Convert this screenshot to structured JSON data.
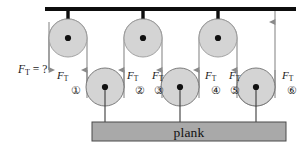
{
  "figure": {
    "colors": {
      "pulley_fill": "#d4d4d4",
      "pulley_stroke": "#8c8c8c",
      "plank_fill": "#a9a9a9",
      "plank_stroke": "#4a4a4a",
      "rope": "#8a8a8a",
      "support_bar": "#0d0d0d",
      "hub": "#111111",
      "text": "#1a1a1a"
    },
    "unknown_force": {
      "symbol": "F",
      "subscript": "T",
      "equals": "= ?"
    },
    "plank": {
      "label": "plank"
    },
    "force_labels": [
      {
        "id": "ft-1",
        "symbol": "F",
        "subscript": "T",
        "x": 57,
        "y": 70
      },
      {
        "id": "ft-2",
        "symbol": "F",
        "subscript": "T",
        "x": 127,
        "y": 70
      },
      {
        "id": "ft-3",
        "symbol": "F",
        "subscript": "T",
        "x": 152,
        "y": 70
      },
      {
        "id": "ft-4",
        "symbol": "F",
        "subscript": "T",
        "x": 205,
        "y": 70
      },
      {
        "id": "ft-5",
        "symbol": "F",
        "subscript": "T",
        "x": 229,
        "y": 70
      },
      {
        "id": "ft-6",
        "symbol": "F",
        "subscript": "T",
        "x": 282,
        "y": 70
      }
    ],
    "segment_numbers": [
      {
        "id": "num-1",
        "label": "①",
        "x": 71,
        "y": 85
      },
      {
        "id": "num-2",
        "label": "②",
        "x": 135,
        "y": 85
      },
      {
        "id": "num-3",
        "label": "③",
        "x": 154,
        "y": 85
      },
      {
        "id": "num-4",
        "label": "④",
        "x": 211,
        "y": 85
      },
      {
        "id": "num-5",
        "label": "⑤",
        "x": 230,
        "y": 85
      },
      {
        "id": "num-6",
        "label": "⑥",
        "x": 287,
        "y": 85
      }
    ],
    "top_pulleys": [
      {
        "id": "top-pulley-1",
        "cx": 68,
        "cy": 38,
        "r": 19
      },
      {
        "id": "top-pulley-2",
        "cx": 143,
        "cy": 38,
        "r": 19
      },
      {
        "id": "top-pulley-3",
        "cx": 218,
        "cy": 38,
        "r": 19
      }
    ],
    "bottom_pulleys": [
      {
        "id": "bottom-pulley-1",
        "cx": 105,
        "cy": 87,
        "r": 19
      },
      {
        "id": "bottom-pulley-2",
        "cx": 180,
        "cy": 87,
        "r": 19
      },
      {
        "id": "bottom-pulley-3",
        "cx": 256,
        "cy": 87,
        "r": 19
      }
    ],
    "support_bar": {
      "x1": 45,
      "x2": 296,
      "y": 9,
      "thickness": 4
    },
    "plank_rect": {
      "x": 92,
      "y": 122,
      "width": 194,
      "height": 19
    }
  }
}
